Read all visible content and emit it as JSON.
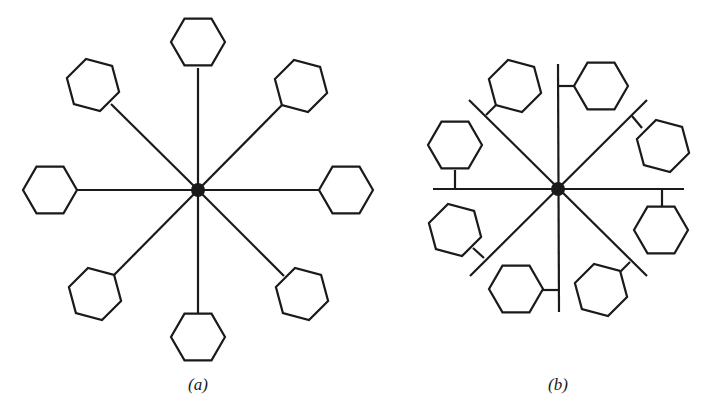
{
  "figure": {
    "panels": [
      {
        "id": "a",
        "caption": "(a)",
        "caption_x": 198,
        "caption_y": 375,
        "center": [
          198,
          190
        ],
        "hub_radius": 7,
        "description": "Star topology: 8 hexagonal nodes each connected by a single spoke to a central hub",
        "nodes": [
          {
            "cx": 198,
            "cy": 42,
            "rot": 0,
            "attach": [
              198,
              68
            ]
          },
          {
            "cx": 301,
            "cy": 86,
            "rot": 15,
            "attach": [
              283,
              104
            ]
          },
          {
            "cx": 346,
            "cy": 190,
            "rot": 0,
            "attach": [
              322,
              190
            ]
          },
          {
            "cx": 302,
            "cy": 294,
            "rot": 15,
            "attach": [
              284,
              276
            ]
          },
          {
            "cx": 198,
            "cy": 337,
            "rot": 0,
            "attach": [
              198,
              313
            ]
          },
          {
            "cx": 95,
            "cy": 294,
            "rot": 15,
            "attach": [
              113,
              276
            ]
          },
          {
            "cx": 50,
            "cy": 190,
            "rot": 0,
            "attach": [
              74,
              190
            ]
          },
          {
            "cx": 93,
            "cy": 85,
            "rot": 15,
            "attach": [
              111,
              104
            ]
          }
        ]
      },
      {
        "id": "b",
        "caption": "(b)",
        "caption_x": 558,
        "caption_y": 375,
        "center": [
          558,
          189
        ],
        "hub_radius": 7,
        "description": "Star of buses: 4 lines crossing at a central hub, each hexagonal node attached to a bus line by a short stub",
        "buses": [
          [
            433,
            189,
            684,
            189
          ],
          [
            558,
            64,
            559,
            312
          ],
          [
            469,
            100,
            647,
            276
          ],
          [
            470,
            276,
            647,
            100
          ]
        ],
        "nodes": [
          {
            "cx": 601,
            "cy": 86,
            "rot": 0,
            "stub": [
              558,
              86,
              577,
              86
            ]
          },
          {
            "cx": 663,
            "cy": 146,
            "rot": 15,
            "stub": [
              632,
              116,
              642,
              128
            ]
          },
          {
            "cx": 661,
            "cy": 230,
            "rot": 0,
            "stub": [
              662,
              189,
              662,
              207
            ]
          },
          {
            "cx": 601,
            "cy": 290,
            "rot": 15,
            "stub": [
              630,
              262,
              620,
              272
            ]
          },
          {
            "cx": 516,
            "cy": 289,
            "rot": 0,
            "stub": [
              558,
              290,
              540,
              290
            ]
          },
          {
            "cx": 455,
            "cy": 230,
            "rot": 15,
            "stub": [
              484,
              258,
              473,
              248
            ]
          },
          {
            "cx": 455,
            "cy": 145,
            "rot": 0,
            "stub": [
              455,
              189,
              455,
              170
            ]
          },
          {
            "cx": 515,
            "cy": 86,
            "rot": 15,
            "stub": [
              486,
              115,
              497,
              104
            ]
          }
        ]
      }
    ],
    "style": {
      "stroke": "#1a1a1a",
      "stroke_width": 2.2,
      "hex_radius": 27,
      "background": "#ffffff"
    }
  }
}
